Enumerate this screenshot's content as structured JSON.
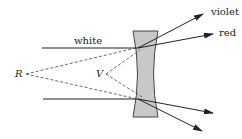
{
  "diagram": {
    "labels": {
      "incident": "white",
      "ray_top_upper": "violet",
      "ray_top_lower": "red",
      "red_focus": "R",
      "violet_focus": "V"
    },
    "colors": {
      "lens_fill": "#c8c8c8",
      "lens_stroke": "#444444",
      "line": "#222222"
    }
  }
}
